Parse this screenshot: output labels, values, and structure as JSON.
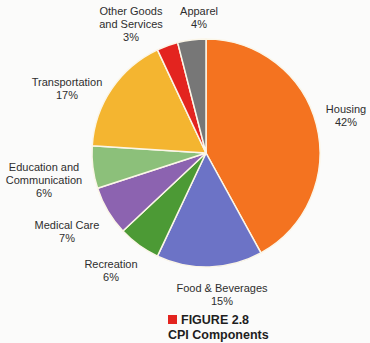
{
  "chart_data": {
    "type": "pie",
    "title": "CPI Components",
    "figure_label": "FIGURE 2.8",
    "start_angle_deg": 0,
    "direction": "clockwise",
    "slices": [
      {
        "label": "Housing",
        "value": 42,
        "pct_text": "42%",
        "color": "#f47320"
      },
      {
        "label": "Food & Beverages",
        "value": 15,
        "pct_text": "15%",
        "color": "#6c73c6"
      },
      {
        "label": "Recreation",
        "value": 6,
        "pct_text": "6%",
        "color": "#4c9a35"
      },
      {
        "label": "Medical Care",
        "value": 7,
        "pct_text": "7%",
        "color": "#8c63b0"
      },
      {
        "label": "Education and Communication",
        "value": 6,
        "pct_text": "6%",
        "color": "#8cc07a"
      },
      {
        "label": "Transportation",
        "value": 17,
        "pct_text": "17%",
        "color": "#f4b530"
      },
      {
        "label": "Other Goods and Services",
        "value": 3,
        "pct_text": "3%",
        "color": "#e3241f"
      },
      {
        "label": "Apparel",
        "value": 4,
        "pct_text": "4%",
        "color": "#777777"
      }
    ]
  },
  "labels": {
    "housing": {
      "line1": "Housing",
      "line2": "42%"
    },
    "food": {
      "line1": "Food & Beverages",
      "line2": "15%"
    },
    "recreation": {
      "line1": "Recreation",
      "line2": "6%"
    },
    "medical": {
      "line1": "Medical Care",
      "line2": "7%"
    },
    "education": {
      "line1": "Education and",
      "line2": "Communication",
      "line3": "6%"
    },
    "transportation": {
      "line1": "Transportation",
      "line2": "17%"
    },
    "other": {
      "line1": "Other Goods",
      "line2": "and Services",
      "line3": "3%"
    },
    "apparel": {
      "line1": "Apparel",
      "line2": "4%"
    }
  },
  "caption": {
    "figure": "FIGURE 2.8",
    "title": "CPI Components",
    "marker_color": "#e3241f"
  },
  "pie_geometry": {
    "cx": 206,
    "cy": 153,
    "r": 114
  }
}
